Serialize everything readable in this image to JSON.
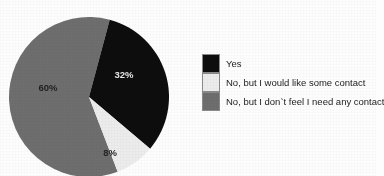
{
  "chart_data": {
    "type": "pie",
    "title": "",
    "subtitle": "",
    "xlabel": "",
    "ylabel": "",
    "legend_position": "right",
    "grid": false,
    "categories": [
      "Yes",
      "No, but I would like some contact",
      "No, but I don`t feel I need any contact"
    ],
    "values": [
      32,
      8,
      60
    ],
    "value_labels": [
      "32%",
      "8%",
      "60%"
    ],
    "colors": [
      "#0d0d0d",
      "#ececec",
      "#6e6e6e"
    ],
    "slices": [
      {
        "label": "Yes",
        "value": 32,
        "value_label": "32%",
        "color": "#0d0d0d",
        "start_angle": 15,
        "end_angle": 130.2
      },
      {
        "label": "No, but I would like some contact",
        "value": 8,
        "value_label": "8%",
        "color": "#ececec",
        "start_angle": 130.2,
        "end_angle": 159.0
      },
      {
        "label": "No, but I don`t feel I need any contact",
        "value": 60,
        "value_label": "60%",
        "color": "#6e6e6e",
        "start_angle": 159.0,
        "end_angle": 375.0
      }
    ]
  },
  "legend": {
    "items": [
      {
        "label": "Yes",
        "color": "#0d0d0d"
      },
      {
        "label": "No, but I would like some contact",
        "color": "#ececec"
      },
      {
        "label": "No, but I don`t feel I need any contact",
        "color": "#6e6e6e"
      }
    ]
  },
  "pie_labels": {
    "black": "32%",
    "light": "8%",
    "gray": "60%"
  },
  "theme": {
    "background": "#fdfdfd",
    "text": "#1c1c1c",
    "swatch_border": "#8a8a8a"
  }
}
